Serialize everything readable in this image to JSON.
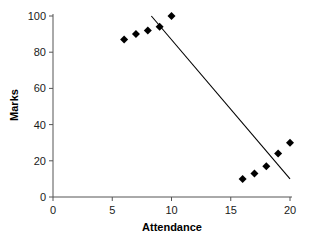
{
  "chart_data": {
    "type": "scatter",
    "title": "",
    "xlabel": "Attendance",
    "ylabel": "Marks",
    "xlim": [
      0,
      20
    ],
    "ylim": [
      0,
      100
    ],
    "xticks": [
      0,
      5,
      10,
      15,
      20
    ],
    "yticks": [
      0,
      20,
      40,
      60,
      80,
      100
    ],
    "xtick_labels": [
      "0",
      "5",
      "10",
      "15",
      "20"
    ],
    "ytick_labels": [
      "0",
      "20",
      "40",
      "60",
      "80",
      "100"
    ],
    "grid": false,
    "legend": false,
    "marker": "diamond",
    "marker_color": "#000000",
    "points": [
      {
        "x": 6,
        "y": 87
      },
      {
        "x": 7,
        "y": 90
      },
      {
        "x": 8,
        "y": 92
      },
      {
        "x": 9,
        "y": 94
      },
      {
        "x": 10,
        "y": 100
      },
      {
        "x": 16,
        "y": 10
      },
      {
        "x": 17,
        "y": 13
      },
      {
        "x": 18,
        "y": 17
      },
      {
        "x": 19,
        "y": 24
      },
      {
        "x": 20,
        "y": 30
      }
    ],
    "series": [
      {
        "name": "Marks vs Attendance",
        "x": [
          6,
          7,
          8,
          9,
          10,
          16,
          17,
          18,
          19,
          20
        ],
        "values": [
          87,
          90,
          92,
          94,
          100,
          10,
          13,
          17,
          24,
          30
        ]
      }
    ],
    "trendline": {
      "type": "line",
      "color": "#000000",
      "x0": 8.3,
      "y0": 100,
      "x1": 20,
      "y1": 10
    }
  }
}
